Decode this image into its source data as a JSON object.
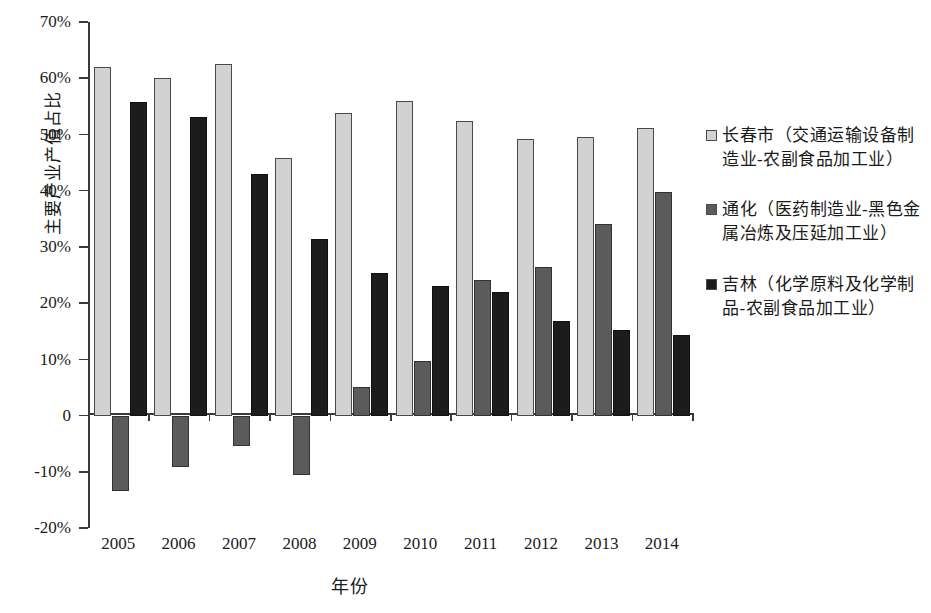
{
  "chart_data": {
    "type": "bar",
    "title": "",
    "xlabel": "年份",
    "ylabel": "主要产业产值占比",
    "categories": [
      "2005",
      "2006",
      "2007",
      "2008",
      "2009",
      "2010",
      "2011",
      "2012",
      "2013",
      "2014"
    ],
    "ylim": [
      -20,
      70
    ],
    "ytick_labels": [
      "70%",
      "60%",
      "50%",
      "40%",
      "30%",
      "20%",
      "10%",
      "0",
      "-10%",
      "-20%"
    ],
    "ytick_values": [
      70,
      60,
      50,
      40,
      30,
      20,
      10,
      0,
      -10,
      -20
    ],
    "grid": false,
    "legend_position": "right",
    "series": [
      {
        "name": "长春市（交通运输设备制造业-农副食品加工业）",
        "color": "#d2d2d2",
        "values": [
          62.0,
          60.1,
          62.6,
          45.8,
          53.9,
          55.9,
          52.4,
          49.2,
          49.5,
          51.2
        ]
      },
      {
        "name": "通化（医药制造业-黑色金属冶炼及压延加工业）",
        "color": "#5b5b5b",
        "values": [
          -13.4,
          -9.2,
          -5.5,
          -10.5,
          5.1,
          9.7,
          24.1,
          26.5,
          34.1,
          39.8
        ]
      },
      {
        "name": "吉林（化学原料及化学制品-农副食品加工业）",
        "color": "#1c1c1c",
        "values": [
          55.8,
          53.1,
          42.9,
          31.4,
          25.4,
          23.0,
          21.9,
          16.9,
          15.2,
          14.4
        ]
      }
    ]
  }
}
